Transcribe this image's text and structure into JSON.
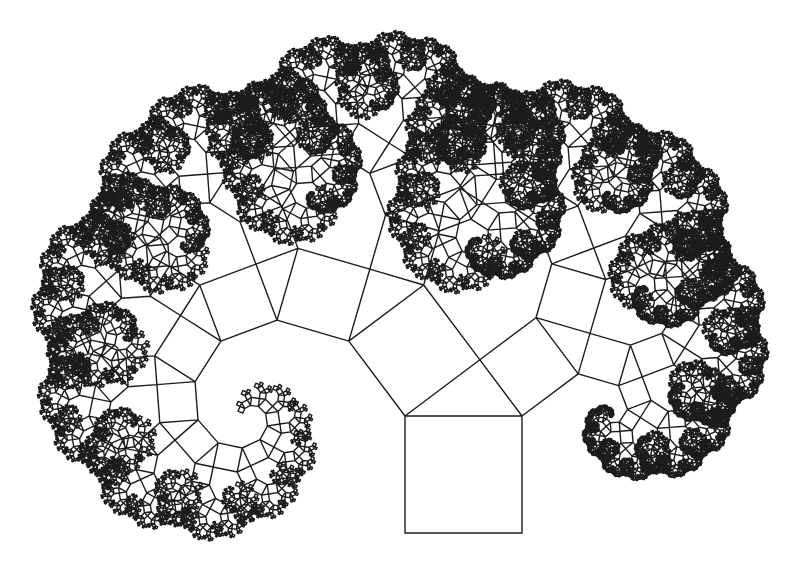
{
  "figure": {
    "title": "Pythagoras tree fractal",
    "background": "#ffffff",
    "stroke_color": "#1c1c1c",
    "stroke_width": 1.4
  },
  "tree": {
    "base_square": {
      "x_left": 405,
      "x_right": 522,
      "y_bottom": 533
    },
    "left_ratio": 0.8,
    "right_ratio": 0.6,
    "angle_deg": 36.87,
    "depth": 14
  }
}
